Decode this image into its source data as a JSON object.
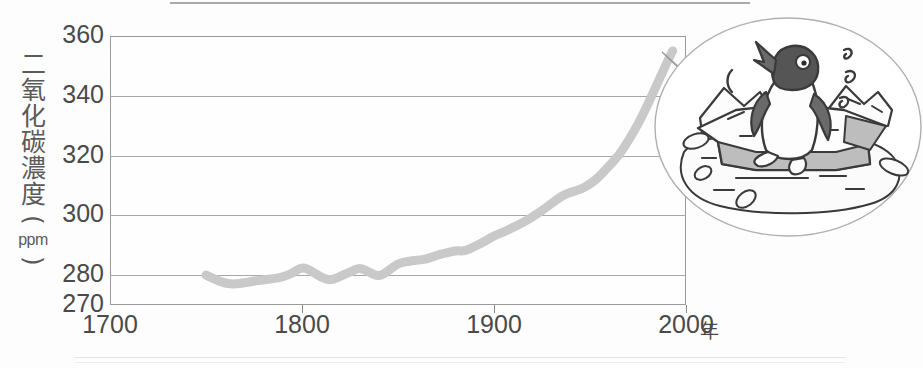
{
  "chart_data": {
    "type": "line",
    "title": "",
    "subtitle": "",
    "xlabel": "年",
    "ylabel": "二氧化碳濃度（ppm）",
    "ylabel_chars": [
      "二",
      "氧",
      "化",
      "碳",
      "濃",
      "度"
    ],
    "ylabel_unit": "ppm",
    "ylabel_paren_open": "(",
    "ylabel_paren_close": ")",
    "xlim": [
      1700,
      2000
    ],
    "ylim": [
      270,
      360
    ],
    "xticks": [
      1700,
      1800,
      1900,
      2000
    ],
    "xtick_labels": [
      "1700",
      "1800",
      "1900",
      "2000"
    ],
    "yticks": [
      270,
      280,
      300,
      320,
      340,
      360
    ],
    "ytick_labels": [
      "270",
      "280",
      "300",
      "320",
      "340",
      "360"
    ],
    "gridlines_y": [
      280,
      300,
      320,
      340
    ],
    "grid": true,
    "legend": false,
    "series": [
      {
        "name": "二氧化碳濃度",
        "color": "#c9c9c9",
        "line_width_px": 9,
        "x": [
          1750,
          1755,
          1760,
          1765,
          1770,
          1775,
          1780,
          1785,
          1790,
          1795,
          1800,
          1805,
          1810,
          1815,
          1820,
          1825,
          1830,
          1835,
          1840,
          1845,
          1850,
          1855,
          1860,
          1865,
          1870,
          1875,
          1880,
          1885,
          1890,
          1895,
          1900,
          1905,
          1910,
          1915,
          1920,
          1925,
          1930,
          1935,
          1940,
          1945,
          1950,
          1955,
          1960,
          1965,
          1970,
          1975,
          1980,
          1985,
          1990,
          1993
        ],
        "y": [
          280.0,
          278.5,
          277.2,
          277.0,
          277.4,
          278.0,
          278.4,
          278.8,
          279.4,
          280.6,
          282.8,
          281.4,
          279.2,
          278.2,
          279.6,
          281.0,
          282.6,
          281.0,
          279.4,
          281.4,
          284.0,
          284.6,
          285.0,
          285.4,
          286.6,
          287.4,
          288.2,
          288.0,
          289.6,
          291.2,
          293.2,
          294.4,
          296.0,
          297.6,
          299.4,
          301.6,
          304.0,
          306.4,
          307.8,
          308.6,
          310.4,
          313.0,
          316.6,
          320.0,
          325.0,
          330.4,
          337.0,
          344.0,
          351.0,
          355.0
        ]
      }
    ],
    "annotations": [
      {
        "name": "callout-bubble",
        "shape": "ellipse-with-tail",
        "target_point": {
          "x": 1993,
          "y": 355
        },
        "content": "penguin-on-melting-ice-illustration"
      }
    ]
  },
  "illustration": {
    "name": "penguin-melting-ice",
    "elements": [
      "penguin",
      "ice-floe",
      "meltwater",
      "sweat-drops",
      "ice-chunks"
    ]
  },
  "icons": {
    "penguin": "penguin-icon",
    "ice": "ice-floe-icon",
    "sweat": "sweat-drop-icon"
  },
  "colors": {
    "curve": "#c9c9c9",
    "grid": "#a8a8a8",
    "frame": "#9a9a9a",
    "text": "#4a4a4a",
    "ice_shade": "#b9b9b9",
    "penguin_dark": "#5c5c5c"
  }
}
